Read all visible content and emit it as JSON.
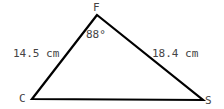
{
  "diagram": {
    "type": "triangle",
    "vertices": [
      {
        "label": "F",
        "x": 97,
        "y": 15
      },
      {
        "label": "C",
        "x": 32,
        "y": 99
      },
      {
        "label": "S",
        "x": 203,
        "y": 100
      }
    ],
    "angle_label": "88°",
    "side_labels": {
      "CF": "14.5 cm",
      "FS": "18.4 cm"
    },
    "colors": {
      "stroke": "#000000",
      "text": "#444444"
    }
  }
}
